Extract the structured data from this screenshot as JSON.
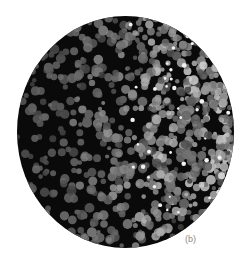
{
  "figure": {
    "panel_label": "(b)",
    "colors": {
      "background": "#ffffff",
      "disc_dark": "#0a0a0a",
      "cell_bright": "#d8d8d8",
      "label": "#8a8a8a"
    }
  }
}
